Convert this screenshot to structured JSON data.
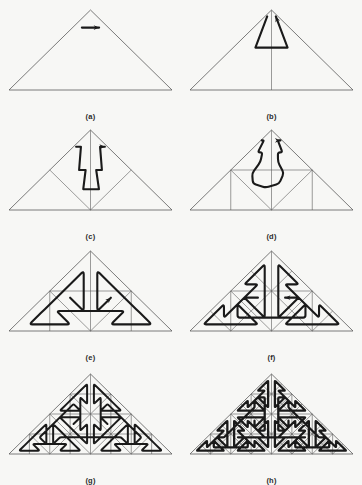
{
  "figure": {
    "background_color": "#f7f7f5",
    "ink_color": "#1a1a1a",
    "grid_color": "#5a5a5a",
    "panel_count": 8,
    "columns": 2,
    "rows": 4
  },
  "geometry": {
    "panel_width": 181,
    "panel_height": 112,
    "triangle": {
      "left_x": 9,
      "right_x": 172,
      "base_y": 88,
      "apex_x": 90.5,
      "apex_y": 8
    },
    "outline_stroke_width": 0.8,
    "grid_stroke_width": 0.6,
    "curve_stroke_width": 2.1,
    "arrow_size": 6
  },
  "panels": [
    {
      "id": "a",
      "caption": "(a)",
      "order": 0,
      "level": 0,
      "row": 0,
      "column": 0,
      "grid_levels": 0,
      "curve_points": "0.26,0.78 0.74,0.78",
      "has_arrow": true,
      "has_median": true,
      "corner_radius": 0,
      "description": "base triangle with median and single horizontal arrow"
    },
    {
      "id": "b",
      "caption": "(b)",
      "order": 1,
      "level": 1,
      "row": 0,
      "column": 1,
      "grid_levels": 1,
      "curve_points": "0.17,0.92 0.29,0.53 0.71,0.53 0.83,0.92",
      "has_arrow": true,
      "has_median": true,
      "corner_radius": 0,
      "description": "first iteration, trapezoidal polyline inside the triangle"
    },
    {
      "id": "c",
      "caption": "(c)",
      "order": 2,
      "level": 2,
      "row": 1,
      "column": 0,
      "grid_levels": 2,
      "curve_points": "0.08,0.79 0.22,0.79 0.36,0.50 0.44,0.50 0.44,0.26 0.57,0.26 0.57,0.50 0.64,0.50 0.78,0.79 0.92,0.79",
      "has_arrow": true,
      "has_median": true,
      "corner_radius": 0,
      "description": "second iteration, staircase curve with central stem"
    },
    {
      "id": "d",
      "caption": "(d)",
      "order": 3,
      "level": 3,
      "row": 1,
      "column": 1,
      "grid_levels": 3,
      "curve_points": "0.04,0.87 0.14,0.87 0.20,0.72 0.30,0.72 0.33,0.60 0.28,0.46 0.33,0.33 0.45,0.28 0.57,0.33 0.64,0.46 0.60,0.60 0.64,0.72 0.74,0.72 0.80,0.87 0.92,0.87",
      "has_arrow": true,
      "has_median": true,
      "corner_radius": 3,
      "description": "third iteration, rounded corners with octagonal central loop"
    },
    {
      "id": "e",
      "caption": "(e)",
      "order": 4,
      "level": 4,
      "row": 2,
      "column": 0,
      "grid_levels": 3,
      "curve_points": "",
      "has_arrow": true,
      "has_median": true,
      "corner_radius": 3,
      "description": "fourth iteration, dense curve with plus-shaped bulges"
    },
    {
      "id": "f",
      "caption": "(f)",
      "order": 5,
      "level": 5,
      "row": 2,
      "column": 1,
      "grid_levels": 4,
      "curve_points": "",
      "has_arrow": true,
      "has_median": true,
      "corner_radius": 2.4,
      "description": "fifth iteration, many rounded loop motifs on a 16-cell grid"
    },
    {
      "id": "g",
      "caption": "(g)",
      "order": 6,
      "level": 6,
      "row": 3,
      "column": 0,
      "grid_levels": 5,
      "curve_points": "",
      "has_arrow": false,
      "has_median": true,
      "corner_radius": 1.6,
      "description": "sixth iteration, curve nearly fills the triangle"
    },
    {
      "id": "h",
      "caption": "(h)",
      "order": 7,
      "level": 7,
      "row": 3,
      "column": 1,
      "grid_levels": 6,
      "curve_points": "",
      "has_arrow": false,
      "has_median": false,
      "corner_radius": 0.9,
      "description": "seventh iteration, triangle appears almost solid black"
    }
  ]
}
